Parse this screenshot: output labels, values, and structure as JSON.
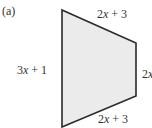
{
  "figure": {
    "part_label": "(a)",
    "shape": "quadrilateral",
    "fill_color": "#ebebeb",
    "stroke_color": "#2a2a2a",
    "vertices": [
      [
        62,
        10
      ],
      [
        136,
        43
      ],
      [
        136,
        96
      ],
      [
        62,
        127
      ]
    ],
    "sides": {
      "top": "2x + 3",
      "left": "3x + 1",
      "right": "2x",
      "bottom": "2x + 3"
    }
  }
}
